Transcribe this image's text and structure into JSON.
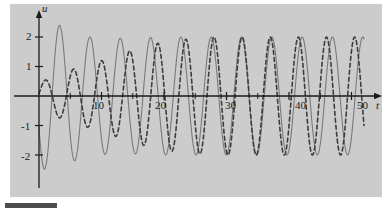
{
  "figure": {
    "background_color": "#cccccc",
    "page_color": "#ffffff",
    "axis_color": "#1a1a1a",
    "bottom_bar_color": "#4d4d4d"
  },
  "axes": {
    "y_axis_label": "u",
    "x_axis_label": "t",
    "y_ticks": [
      {
        "label": "2",
        "value": 2
      },
      {
        "label": "1",
        "value": 1
      },
      {
        "label": "-1",
        "value": -1
      },
      {
        "label": "-2",
        "value": -2
      }
    ],
    "x_ticks": [
      {
        "label": "10",
        "value": 10
      },
      {
        "label": "20",
        "value": 20
      },
      {
        "label": "30",
        "value": 30
      },
      {
        "label": "40",
        "value": 40
      },
      {
        "label": "50",
        "value": 50
      }
    ],
    "x_minor_ticks": [
      5,
      15,
      25,
      35,
      45
    ],
    "xlim": [
      -1.5,
      53
    ],
    "ylim": [
      -2.9,
      2.9
    ],
    "grid": false
  },
  "chart_data": {
    "type": "line",
    "title": "",
    "subtitle": "",
    "xlabel": "t",
    "ylabel": "u",
    "xlim": [
      -1.5,
      53
    ],
    "ylim": [
      -2.9,
      2.9
    ],
    "grid": false,
    "legend": "none",
    "xticks": [
      10,
      20,
      30,
      40,
      50
    ],
    "yticks": [
      -2,
      -1,
      1,
      2
    ],
    "series": [
      {
        "name": "solid-curve",
        "style": "solid",
        "color": "#7a7a7a",
        "linewidth": 1.1,
        "description": "Slowly beating sinusoid, amplitude near 2, period near 4.85, starting near -2.6 at t=0 and rising",
        "model": "amplitude*sin(2*pi*t/period + phase)",
        "amplitude": 2.0,
        "period": 4.85,
        "phase_deg": 205,
        "amplitude_envelope": [
          {
            "t": 0,
            "a": 2.5
          },
          {
            "t": 3,
            "a": 2.42
          },
          {
            "t": 8,
            "a": 2.0
          },
          {
            "t": 14,
            "a": 1.95
          },
          {
            "t": 20,
            "a": 2.0
          },
          {
            "t": 30,
            "a": 2.0
          },
          {
            "t": 40,
            "a": 2.0
          },
          {
            "t": 50,
            "a": 2.0
          }
        ],
        "t_start": 0,
        "t_end": 52
      },
      {
        "name": "dashed-curve",
        "style": "dashed",
        "color": "#3d3d3d",
        "linewidth": 1.6,
        "dash_pattern": "4,3",
        "description": "Growing then saturating sinusoid, amplitude rises from ~0.4 to ~2, period near 4.5",
        "model": "amplitude_envelope(t)*sin(2*pi*t/period + phase)",
        "period": 4.5,
        "phase_deg": 10,
        "amplitude_envelope": [
          {
            "t": 0,
            "a": 0.45
          },
          {
            "t": 3,
            "a": 0.72
          },
          {
            "t": 6,
            "a": 0.95
          },
          {
            "t": 10,
            "a": 1.2
          },
          {
            "t": 14,
            "a": 1.5
          },
          {
            "t": 18,
            "a": 1.75
          },
          {
            "t": 22,
            "a": 1.9
          },
          {
            "t": 28,
            "a": 2.0
          },
          {
            "t": 34,
            "a": 2.0
          },
          {
            "t": 42,
            "a": 2.0
          },
          {
            "t": 52,
            "a": 2.0
          }
        ],
        "t_start": 0,
        "t_end": 52
      }
    ]
  }
}
